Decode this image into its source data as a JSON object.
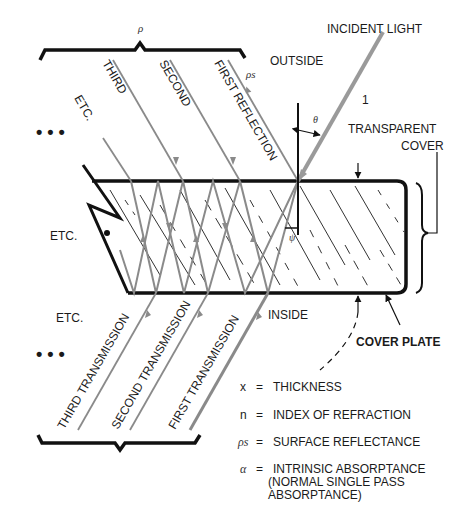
{
  "labels": {
    "incident_light": "INCIDENT LIGHT",
    "outside": "OUTSIDE",
    "inside": "INSIDE",
    "transparent_cover_1": "TRANSPARENT",
    "transparent_cover_2": "COVER",
    "cover_plate": "COVER PLATE",
    "first_reflection": "FIRST REFLECTION",
    "second_reflection": "SECOND",
    "third_reflection": "THIRD",
    "etc_top": "ETC.",
    "etc_mid": "ETC.",
    "etc_bottom": "ETC.",
    "first_transmission": "FIRST TRANSMISSION",
    "second_transmission": "SECOND TRANSMISSION",
    "third_transmission": "THIRD TRANSMISSION",
    "one": "1",
    "rho": "ρ",
    "rho_s": "ρs",
    "theta": "θ",
    "psi": "ψ",
    "ellipsis_top": "• • •",
    "ellipsis_bottom": "• • •"
  },
  "legend": [
    {
      "symbol": "x",
      "eq": "=",
      "text": "THICKNESS"
    },
    {
      "symbol": "n",
      "eq": "=",
      "text": "INDEX OF REFRACTION"
    },
    {
      "symbol": "ρs",
      "eq": "=",
      "text": "SURFACE REFLECTANCE"
    },
    {
      "symbol": "α",
      "eq": "=",
      "text": "INTRINSIC ABSORPTANCE",
      "line2": "(NORMAL SINGLE PASS",
      "line3": "ABSORPTANCE)"
    }
  ],
  "colors": {
    "ink": "#111111",
    "ray": "#8a8a8a",
    "incident": "#9a9a9a",
    "hatch": "#333333"
  }
}
